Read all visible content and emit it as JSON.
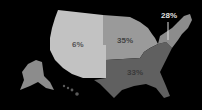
{
  "map": {
    "title": "",
    "regions": [
      {
        "id": "west",
        "name": "West",
        "value": "6%",
        "color": "#c2c2c2",
        "label_color": "#555555"
      },
      {
        "id": "midwest",
        "name": "Midwest",
        "value": "35%",
        "color": "#9a9a9a",
        "label_color": "#444444"
      },
      {
        "id": "south",
        "name": "South",
        "value": "33%",
        "color": "#606060",
        "label_color": "#3a3a3a"
      },
      {
        "id": "northeast",
        "name": "Northeast",
        "value": "28%",
        "color": "#8c8c8c",
        "label_color": "#e0e0e0"
      }
    ],
    "background": "#000000"
  }
}
